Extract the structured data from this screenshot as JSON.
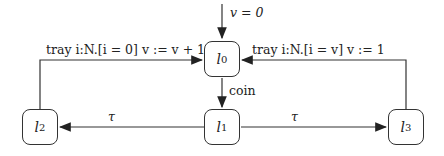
{
  "diagram": {
    "type": "timed-automaton",
    "locations": [
      {
        "id": "l0",
        "base": "l",
        "sub": "0"
      },
      {
        "id": "l1",
        "base": "l",
        "sub": "1"
      },
      {
        "id": "l2",
        "base": "l",
        "sub": "2"
      },
      {
        "id": "l3",
        "base": "l",
        "sub": "3"
      }
    ],
    "edges": [
      {
        "from": "init",
        "to": "l0",
        "label": "v = 0"
      },
      {
        "from": "l0",
        "to": "l1",
        "label": "coin"
      },
      {
        "from": "l1",
        "to": "l2",
        "label": "τ"
      },
      {
        "from": "l1",
        "to": "l3",
        "label": "τ"
      },
      {
        "from": "l2",
        "to": "l0",
        "label": "tray i:N.[i = 0]  v := v + 1"
      },
      {
        "from": "l3",
        "to": "l0",
        "label": "tray i:N.[i = v]  v := 1"
      }
    ]
  }
}
